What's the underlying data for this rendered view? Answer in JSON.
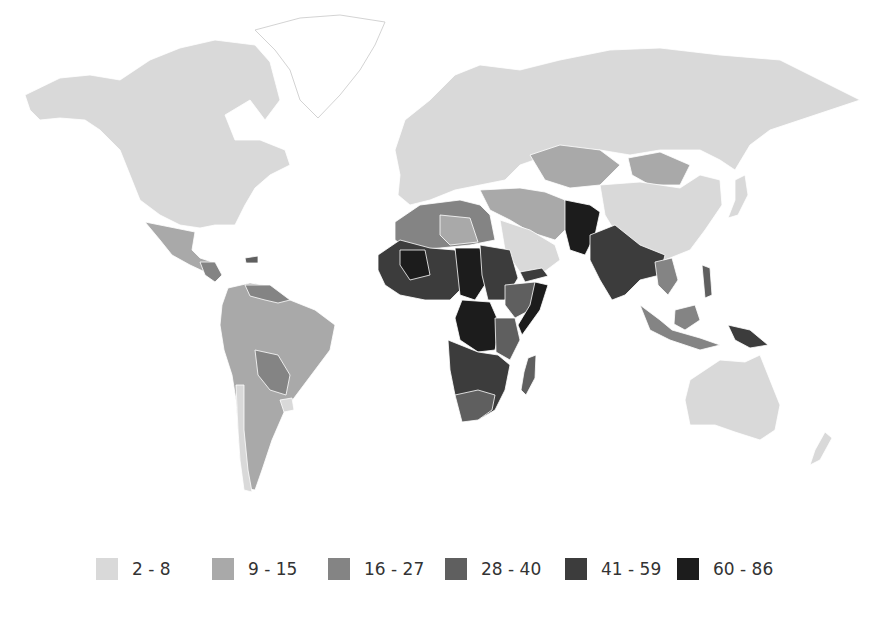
{
  "map": {
    "type": "choropleth",
    "projection": "world",
    "no_data_color": "#ffffff",
    "classes": [
      {
        "label": "2 - 8",
        "min": 2,
        "max": 8,
        "color": "#d9d9d9"
      },
      {
        "label": "9 - 15",
        "min": 9,
        "max": 15,
        "color": "#a9a9a9"
      },
      {
        "label": "16 - 27",
        "min": 16,
        "max": 27,
        "color": "#848484"
      },
      {
        "label": "28 - 40",
        "min": 28,
        "max": 40,
        "color": "#5f5f5f"
      },
      {
        "label": "41 - 59",
        "min": 41,
        "max": 59,
        "color": "#3c3c3c"
      },
      {
        "label": "60 - 86",
        "min": 60,
        "max": 86,
        "color": "#1c1c1c"
      }
    ],
    "regions": [
      {
        "name": "North America (USA, Canada)",
        "class": "2 - 8"
      },
      {
        "name": "Greenland",
        "class": "no data"
      },
      {
        "name": "Mexico",
        "class": "9 - 15"
      },
      {
        "name": "Central America",
        "class": "16 - 27"
      },
      {
        "name": "Haiti",
        "class": "28 - 40"
      },
      {
        "name": "Venezuela / Guyana",
        "class": "16 - 27"
      },
      {
        "name": "Brazil / Colombia / Peru / Argentina",
        "class": "9 - 15"
      },
      {
        "name": "Bolivia / Paraguay",
        "class": "16 - 27"
      },
      {
        "name": "Chile / Uruguay",
        "class": "2 - 8"
      },
      {
        "name": "Europe",
        "class": "2 - 8"
      },
      {
        "name": "Russia",
        "class": "2 - 8"
      },
      {
        "name": "China / Japan",
        "class": "2 - 8"
      },
      {
        "name": "Mongolia / Kazakhstan",
        "class": "9 - 15"
      },
      {
        "name": "Turkey / Iran",
        "class": "9 - 15"
      },
      {
        "name": "Saudi Arabia",
        "class": "2 - 8"
      },
      {
        "name": "Afghanistan / Pakistan",
        "class": "60 - 86"
      },
      {
        "name": "India / Myanmar",
        "class": "41 - 59"
      },
      {
        "name": "Southeast Asia",
        "class": "16 - 27"
      },
      {
        "name": "Papua New Guinea",
        "class": "41 - 59"
      },
      {
        "name": "Australia / New Zealand",
        "class": "2 - 8"
      },
      {
        "name": "North Africa (Morocco, Algeria, Libya, Egypt)",
        "class": "16 - 27"
      },
      {
        "name": "Sahel / West Africa",
        "class": "41 - 59"
      },
      {
        "name": "Chad / Central Africa / DR Congo",
        "class": "60 - 86"
      },
      {
        "name": "Sudan / Somalia",
        "class": "41 - 59"
      },
      {
        "name": "Ethiopia / Kenya / Tanzania",
        "class": "28 - 40"
      },
      {
        "name": "Southern Africa",
        "class": "28 - 40"
      },
      {
        "name": "Madagascar",
        "class": "28 - 40"
      }
    ]
  },
  "legend": {
    "items": [
      {
        "label": "2 - 8"
      },
      {
        "label": "9 - 15"
      },
      {
        "label": "16 - 27"
      },
      {
        "label": "28 - 40"
      },
      {
        "label": "41 - 59"
      },
      {
        "label": "60 - 86"
      }
    ]
  }
}
